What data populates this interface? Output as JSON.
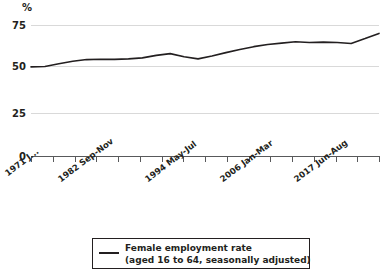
{
  "chart_data": {
    "type": "line",
    "title": "",
    "subtitle": "",
    "xlabel": "",
    "ylabel": "%",
    "ylim": [
      0,
      80
    ],
    "yticks": [
      0,
      25,
      50,
      75
    ],
    "ytick_labels": [
      "0",
      "25",
      "50",
      "75"
    ],
    "grid": true,
    "grid_axis": "y",
    "legend_position": "bottom-center",
    "xtick_labels": [
      "1971 J...",
      "1982 Sep-Nov",
      "1994 May-Jul",
      "2006 Jan-Mar",
      "2017 Jun-Aug"
    ],
    "x_minor_tick_count": 16,
    "series": [
      {
        "name": "Female employment rate",
        "note": "(aged 16 to 64, seasonally adjusted)",
        "color": "#231f20",
        "x": [
          "1971",
          "1973",
          "1975",
          "1977",
          "1979",
          "1981",
          "1982",
          "1984",
          "1986",
          "1988",
          "1990",
          "1992",
          "1994",
          "1996",
          "1998",
          "2000",
          "2002",
          "2004",
          "2006",
          "2008",
          "2010",
          "2012",
          "2014",
          "2016",
          "2017",
          "2018"
        ],
        "values": [
          51.0,
          51.2,
          52.8,
          54.2,
          55.2,
          55.4,
          55.3,
          55.6,
          56.2,
          57.6,
          58.6,
          56.8,
          55.6,
          57.2,
          59.2,
          61.0,
          62.6,
          63.8,
          64.6,
          65.4,
          65.0,
          65.2,
          65.0,
          64.4,
          67.2,
          70.2
        ]
      }
    ],
    "annotations": []
  },
  "legend": {
    "entries": [
      {
        "line1": "Female employment rate",
        "line2": "(aged 16 to 64, seasonally adjusted)",
        "color": "#231f20"
      }
    ]
  },
  "axes": {
    "y_unit": "%",
    "y_labels": [
      "75",
      "50",
      "25",
      "0"
    ],
    "x_labels": [
      "1971 J...",
      "1982 Sep-Nov",
      "1994 May-Jul",
      "2006 Jan-Mar",
      "2017 Jun-Aug"
    ]
  },
  "colors": {
    "line": "#231f20",
    "grid": "#d9d9d9",
    "axis": "#58595b",
    "text": "#231f20",
    "background": "#ffffff"
  }
}
